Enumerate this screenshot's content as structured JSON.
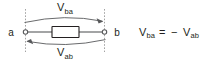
{
  "figure": {
    "nodes": {
      "left_label": "a",
      "right_label": "b"
    },
    "arcs": {
      "top": {
        "label_base": "V",
        "label_sub": "ba",
        "direction": "right",
        "meaning": "voltage rise from a to b"
      },
      "bottom": {
        "label_base": "V",
        "label_sub": "ab",
        "direction": "left",
        "meaning": "voltage rise from b to a"
      }
    },
    "equation": {
      "lhs_base": "V",
      "lhs_sub": "ba",
      "equals": "=",
      "minus": "−",
      "rhs_base": "V",
      "rhs_sub": "ab",
      "full_text": "V_ba = − V_ab"
    },
    "element": {
      "type": "resistor",
      "label": ""
    },
    "colors": {
      "background": "#ffffff",
      "text": "#231f20",
      "wire": "#58595b",
      "dashed_guide": "#8c8c8c",
      "element_outline": "#231f20"
    }
  }
}
